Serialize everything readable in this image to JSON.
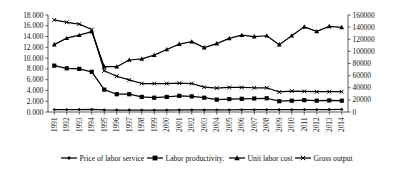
{
  "chart_data": {
    "type": "line",
    "title": "",
    "xlabel": "",
    "ylabel": "",
    "grid": false,
    "legend_position": "bottom",
    "categories": [
      "1991",
      "1992",
      "1993",
      "1994",
      "1995",
      "1996",
      "1997",
      "1998",
      "1999",
      "2000",
      "2001",
      "2002",
      "2003",
      "2004",
      "2005",
      "2006",
      "2007",
      "2008",
      "2009",
      "2010",
      "2011",
      "2012",
      "2013",
      "2014"
    ],
    "axes": {
      "left": {
        "min": 0,
        "max": 18,
        "step": 2,
        "ticks": [
          "0.000",
          "2.000",
          "4.000",
          "6.000",
          "8.000",
          "10.000",
          "12.000",
          "14.000",
          "16.000",
          "18.000"
        ]
      },
      "right": {
        "min": 0,
        "max": 160000,
        "step": 20000,
        "ticks": [
          "0",
          "20000",
          "40000",
          "60000",
          "80000",
          "100000",
          "120000",
          "140000",
          "160000"
        ]
      }
    },
    "series": [
      {
        "name": "Price of labor service",
        "marker": "diamond",
        "axis": "left",
        "values": [
          0.45,
          0.45,
          0.46,
          0.47,
          0.38,
          0.36,
          0.36,
          0.35,
          0.34,
          0.35,
          0.38,
          0.38,
          0.38,
          0.39,
          0.4,
          0.42,
          0.43,
          0.44,
          0.42,
          0.43,
          0.45,
          0.45,
          0.46,
          0.47
        ]
      },
      {
        "name": "Labor productivity.",
        "marker": "square",
        "axis": "left",
        "values": [
          8.6,
          8.1,
          8.0,
          7.45,
          4.15,
          3.3,
          3.3,
          2.8,
          2.65,
          2.8,
          3.0,
          2.9,
          2.65,
          2.3,
          2.4,
          2.45,
          2.5,
          2.55,
          2.0,
          2.1,
          2.2,
          2.1,
          2.15,
          2.1
        ]
      },
      {
        "name": "Unit labor cost",
        "marker": "triangle",
        "axis": "left",
        "values": [
          12.5,
          13.7,
          14.25,
          14.9,
          8.4,
          8.4,
          9.65,
          9.85,
          10.55,
          11.6,
          12.6,
          13.05,
          11.95,
          12.7,
          13.65,
          14.25,
          14.0,
          14.15,
          12.5,
          14.15,
          15.8,
          14.95,
          15.9,
          15.7
        ]
      },
      {
        "name": "Gross output",
        "marker": "cross",
        "axis": "right",
        "values": [
          152000,
          148000,
          145000,
          136000,
          68000,
          59000,
          53000,
          47000,
          47000,
          47000,
          47500,
          47000,
          41000,
          39500,
          40500,
          40500,
          40000,
          40000,
          33000,
          34500,
          34000,
          33500,
          33500,
          33500
        ]
      }
    ]
  }
}
